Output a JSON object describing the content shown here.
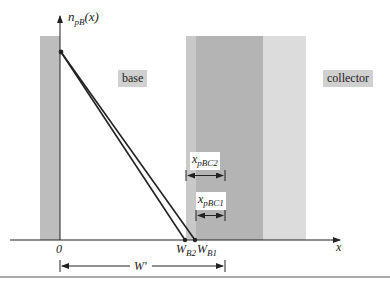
{
  "diagram": {
    "y_axis_label": "n",
    "y_axis_sub": "pB",
    "y_axis_arg": "(x)",
    "x_axis_label": "x",
    "origin_label": "0",
    "region_labels": {
      "base": "base",
      "collector": "collector"
    },
    "widths": {
      "xpbc2_main": "x",
      "xpbc2_sub": "pBC2",
      "xpbc1_main": "x",
      "xpbc1_sub": "pBC1"
    },
    "tick_labels": {
      "wb2_main": "W",
      "wb2_sub": "B2",
      "wb1_main": "W",
      "wb1_sub": "B1"
    },
    "dimension_label": "W'",
    "colors": {
      "emitter_strip": "#bdbdbd",
      "depletion_light": "#c9c9c9",
      "collector_dark": "#b4b4b4",
      "collector_light": "#dcdcdc",
      "label_box": "#d0d0d0",
      "line": "#222222"
    }
  }
}
